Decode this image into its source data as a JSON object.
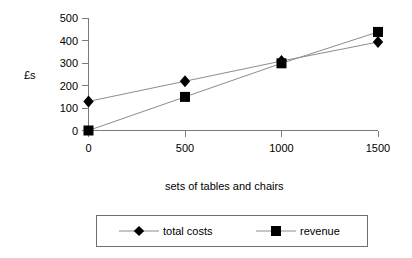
{
  "chart_data": {
    "type": "line",
    "title": "",
    "subtitle": "",
    "xlabel": "sets of tables and chairs",
    "ylabel": "£s",
    "x": [
      0,
      500,
      1000,
      1500
    ],
    "categories": [
      "0",
      "500",
      "1000",
      "1500"
    ],
    "xlim": [
      0,
      1500
    ],
    "ylim": [
      0,
      500
    ],
    "xticks": [
      "0",
      "500",
      "1000",
      "1500"
    ],
    "yticks": [
      "0",
      "100",
      "200",
      "300",
      "400",
      "500"
    ],
    "grid": false,
    "legend_position": "bottom",
    "series": [
      {
        "name": "total costs",
        "marker": "diamond",
        "marker_color": "#000000",
        "line_color": "#8c8c8c",
        "values": [
          130,
          220,
          310,
          395
        ]
      },
      {
        "name": "revenue",
        "marker": "square",
        "marker_color": "#000000",
        "line_color": "#8c8c8c",
        "values": [
          0,
          150,
          300,
          440
        ]
      }
    ],
    "annotations": []
  },
  "axes": {
    "y_axis_label": "£s",
    "x_axis_label": "sets of tables and chairs",
    "y_tick_labels": [
      "500",
      "400",
      "300",
      "200",
      "100",
      "0"
    ],
    "x_tick_labels": [
      "0",
      "500",
      "1000",
      "1500"
    ]
  },
  "legend": {
    "entries": [
      {
        "label": "total costs",
        "marker": "diamond"
      },
      {
        "label": "revenue",
        "marker": "square"
      }
    ]
  },
  "colors": {
    "marker": "#000000",
    "line": "#8c8c8c",
    "axis": "#7a7a7a",
    "legend_border": "#6f6f6f",
    "background": "#ffffff"
  }
}
